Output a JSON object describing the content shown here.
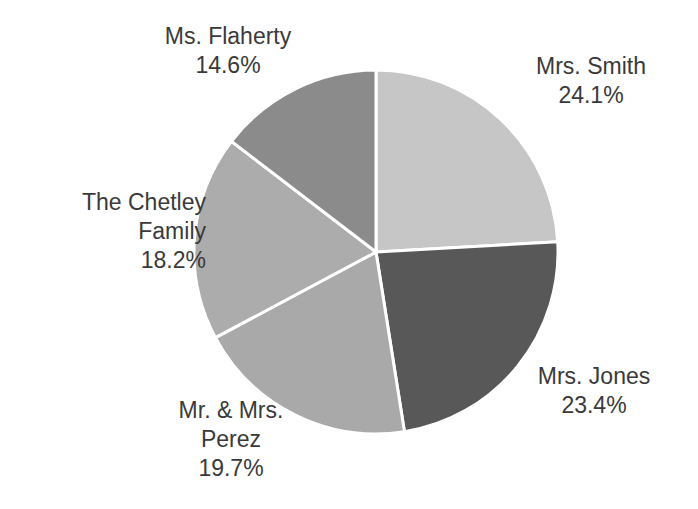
{
  "chart_data": {
    "type": "pie",
    "title": "",
    "subtitle": "",
    "xlabel": "",
    "ylabel": "",
    "grid": false,
    "legend_position": "none",
    "labels_position": "outside",
    "start_angle_deg": 0,
    "direction": "clockwise",
    "categories": [
      "Mrs. Smith",
      "Mrs. Jones",
      "Mr. & Mrs. Perez",
      "The Chetley Family",
      "Ms. Flaherty"
    ],
    "values": [
      24.1,
      23.4,
      19.7,
      18.2,
      14.6
    ],
    "value_unit": "%",
    "colors": [
      "#c6c6c6",
      "#585858",
      "#a9a9a9",
      "#acacac",
      "#8b8b8b"
    ],
    "slice_border_color": "#ffffff",
    "slice_border_width": 3,
    "slices": [
      {
        "name": "Mrs. Smith",
        "value": 24.1,
        "value_label": "24.1%",
        "color": "#c6c6c6",
        "start_deg": 0.0,
        "sweep_deg": 86.76,
        "end_deg": 86.76
      },
      {
        "name": "Mrs. Jones",
        "value": 23.4,
        "value_label": "23.4%",
        "color": "#585858",
        "start_deg": 86.76,
        "sweep_deg": 84.24,
        "end_deg": 171.0
      },
      {
        "name": "Mr. & Mrs. Perez",
        "value": 19.7,
        "value_label": "19.7%",
        "color": "#a9a9a9",
        "start_deg": 171.0,
        "sweep_deg": 70.92,
        "end_deg": 241.92
      },
      {
        "name": "The Chetley Family",
        "value": 18.2,
        "value_label": "18.2%",
        "color": "#acacac",
        "start_deg": 241.92,
        "sweep_deg": 65.52,
        "end_deg": 307.44
      },
      {
        "name": "Ms. Flaherty",
        "value": 14.6,
        "value_label": "14.6%",
        "color": "#8b8b8b",
        "start_deg": 307.44,
        "sweep_deg": 52.56,
        "end_deg": 360.0
      }
    ]
  },
  "labels": {
    "flaherty": {
      "name": "Ms. Flaherty",
      "value": "14.6%"
    },
    "smith": {
      "name": "Mrs. Smith",
      "value": "24.1%"
    },
    "jones": {
      "name": "Mrs. Jones",
      "value": "23.4%"
    },
    "perez": {
      "name_line1": "Mr. & Mrs.",
      "name_line2": "Perez",
      "value": "19.7%"
    },
    "chetley": {
      "name_line1": "The Chetley",
      "name_line2": "Family",
      "value": "18.2%"
    }
  },
  "geometry": {
    "center_x": 376,
    "center_y": 252,
    "radius": 182,
    "canvas_width": 698,
    "canvas_height": 509,
    "background": "#ffffff"
  }
}
